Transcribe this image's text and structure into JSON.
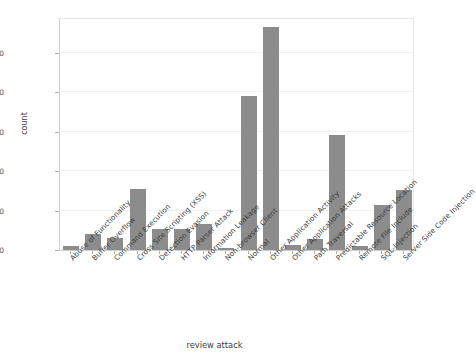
{
  "chart_data": {
    "type": "bar",
    "title": "",
    "xlabel": "review attack",
    "ylabel": "count",
    "ylim": [
      0,
      29500
    ],
    "grid": true,
    "legend": null,
    "bar_color": "#8c8c8c",
    "yticks": [
      0,
      5000,
      10000,
      15000,
      20000,
      25000
    ],
    "ytick_labels": [
      "0",
      "5000",
      "10000",
      "15000",
      "20000",
      "25000"
    ],
    "categories": [
      "Abuse of Functionality",
      "Buffer Overflow",
      "Command Execution",
      "Cross Site Scripting (XSS)",
      "Detection Evasion",
      "HTTP Parser Attack",
      "Information Leakage",
      "Non-browser Client",
      "Normal",
      "Other Application Activity",
      "Other Application Attacks",
      "Path Traversal",
      "Predictable Resource Location",
      "Remote File Include",
      "SQL-Injection",
      "Server Side Code Injection"
    ],
    "values": [
      450,
      2000,
      1550,
      7780,
      2600,
      2620,
      3300,
      230,
      19500,
      28250,
      620,
      1400,
      14540,
      480,
      5750,
      7650
    ]
  }
}
